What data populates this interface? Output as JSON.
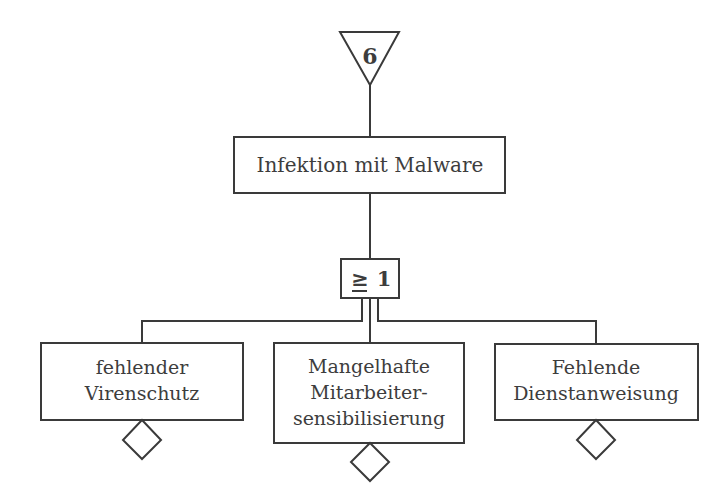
{
  "diagram": {
    "type": "fault-tree",
    "transfer_symbol": {
      "shape": "inverted-triangle",
      "label": "6"
    },
    "top_event": {
      "label": "Infektion mit Malware"
    },
    "gate": {
      "type": "OR",
      "symbol": "≥",
      "value": "1"
    },
    "basic_events": [
      {
        "lines": [
          "fehlender",
          "Virenschutz"
        ],
        "symbol": "diamond"
      },
      {
        "lines": [
          "Mangelhafte",
          "Mitarbeiter-",
          "sensibilisierung"
        ],
        "symbol": "diamond"
      },
      {
        "lines": [
          "Fehlende",
          "Dienstanweisung"
        ],
        "symbol": "diamond"
      }
    ],
    "colors": {
      "line": "#3a3a3a",
      "text": "#3d3d3d",
      "background": "#ffffff"
    }
  }
}
